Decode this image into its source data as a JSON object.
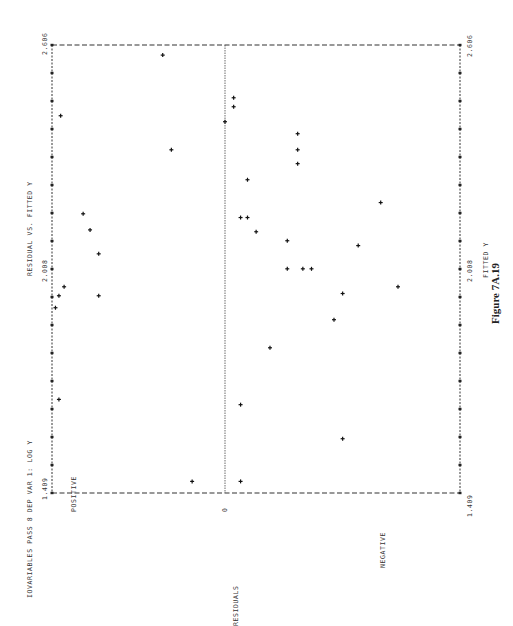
{
  "header": {
    "run_title": "IOVARIABLES PASS 8  DEP VAR 1: LOG Y",
    "plot_title": "RESIDUAL VS. FITTED Y"
  },
  "caption": "Figure 7A.19",
  "axes": {
    "fitted_axis_label": "FITTED Y",
    "fitted_ticks": [
      "1.409",
      "2.008",
      "2.606"
    ],
    "residual_axis_label": "RESIDUALS",
    "residual_positive_label": "POSITIVE",
    "residual_negative_label": "NEGATIVE",
    "residual_zero_label": "0"
  },
  "chart_data": {
    "type": "scatter",
    "title": "RESIDUAL VS. FITTED Y",
    "subtitle": "IOVARIABLES PASS 8  DEP VAR 1: LOG Y",
    "xlabel": "FITTED Y",
    "ylabel": "RESIDUALS",
    "xlim": [
      1.409,
      2.606
    ],
    "x_ticks": [
      1.409,
      2.008,
      2.606
    ],
    "ylim": [
      -1,
      1
    ],
    "y_tick_labels": {
      "top": "POSITIVE",
      "zero": "0",
      "bottom": "NEGATIVE"
    },
    "y_units": "relative (no numeric scale printed)",
    "grid": false,
    "zero_reference_line": true,
    "orientation_note": "page printed rotated 90 degrees counter-clockwise",
    "points": [
      {
        "x": 2.579,
        "y": 0.36
      },
      {
        "x": 2.417,
        "y": 0.95
      },
      {
        "x": 2.326,
        "y": 0.31
      },
      {
        "x": 2.465,
        "y": -0.05
      },
      {
        "x": 2.441,
        "y": -0.05
      },
      {
        "x": 2.401,
        "y": 0.0
      },
      {
        "x": 2.155,
        "y": 0.82
      },
      {
        "x": 2.112,
        "y": 0.78
      },
      {
        "x": 2.048,
        "y": 0.73
      },
      {
        "x": 1.936,
        "y": 0.96
      },
      {
        "x": 1.936,
        "y": 0.73
      },
      {
        "x": 2.246,
        "y": -0.13
      },
      {
        "x": 2.145,
        "y": -0.13
      },
      {
        "x": 2.107,
        "y": -0.18
      },
      {
        "x": 2.145,
        "y": -0.09
      },
      {
        "x": 2.083,
        "y": -0.36
      },
      {
        "x": 2.008,
        "y": -0.36
      },
      {
        "x": 2.008,
        "y": -0.45
      },
      {
        "x": 2.008,
        "y": -0.5
      },
      {
        "x": 2.369,
        "y": -0.42
      },
      {
        "x": 2.289,
        "y": -0.42
      },
      {
        "x": 2.326,
        "y": -0.42
      },
      {
        "x": 2.185,
        "y": -0.9
      },
      {
        "x": 2.07,
        "y": -0.77
      },
      {
        "x": 1.942,
        "y": -0.68
      },
      {
        "x": 1.797,
        "y": -0.26
      },
      {
        "x": 1.872,
        "y": -0.63
      },
      {
        "x": 1.554,
        "y": -0.68
      },
      {
        "x": 1.645,
        "y": -0.09
      },
      {
        "x": 1.659,
        "y": 0.96
      },
      {
        "x": 1.44,
        "y": 0.19
      },
      {
        "x": 1.44,
        "y": -0.09
      },
      {
        "x": 1.904,
        "y": 0.98
      },
      {
        "x": 1.96,
        "y": 0.93
      },
      {
        "x": 1.96,
        "y": -1.0
      }
    ]
  }
}
